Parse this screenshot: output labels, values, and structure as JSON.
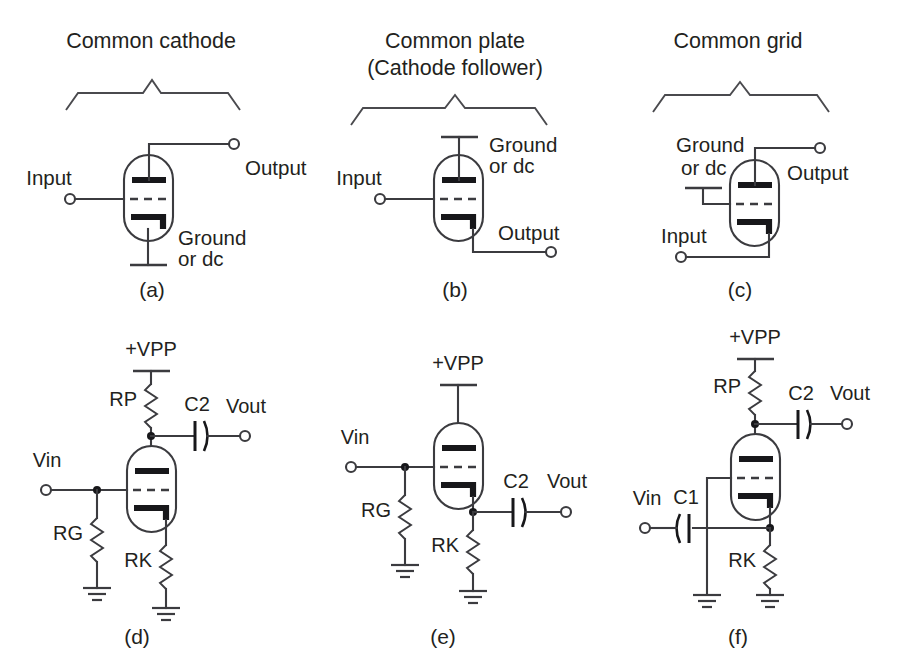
{
  "figure": {
    "colors": {
      "background": "#ffffff",
      "wire": "#3b3b3f",
      "electrode": "#17171a",
      "text": "#231f20"
    }
  },
  "panels": [
    {
      "id": "a",
      "letter": "(a)",
      "title_line1": "Common cathode",
      "title_line2": "",
      "labels": {
        "input": "Input",
        "output": "Output",
        "common_line1": "Ground",
        "common_line2": "or dc"
      }
    },
    {
      "id": "b",
      "letter": "(b)",
      "title_line1": "Common plate",
      "title_line2": "(Cathode follower)",
      "labels": {
        "input": "Input",
        "output": "Output",
        "common_line1": "Ground",
        "common_line2": "or dc"
      }
    },
    {
      "id": "c",
      "letter": "(c)",
      "title_line1": "Common grid",
      "title_line2": "",
      "labels": {
        "input": "Input",
        "output": "Output",
        "common_line1": "Ground",
        "common_line2": "or dc"
      }
    },
    {
      "id": "d",
      "letter": "(d)",
      "title_line1": "",
      "title_line2": "",
      "labels": {
        "supply": "+VPP",
        "plate_resistor": "RP",
        "grid_resistor": "RG",
        "cathode_resistor": "RK",
        "output_cap": "C2",
        "input": "Vin",
        "output": "Vout"
      }
    },
    {
      "id": "e",
      "letter": "(e)",
      "title_line1": "",
      "title_line2": "",
      "labels": {
        "supply": "+VPP",
        "grid_resistor": "RG",
        "cathode_resistor": "RK",
        "output_cap": "C2",
        "input": "Vin",
        "output": "Vout"
      }
    },
    {
      "id": "f",
      "letter": "(f)",
      "title_line1": "",
      "title_line2": "",
      "labels": {
        "supply": "+VPP",
        "plate_resistor": "RP",
        "cathode_resistor": "RK",
        "input_cap": "C1",
        "output_cap": "C2",
        "input": "Vin",
        "output": "Vout"
      }
    }
  ]
}
